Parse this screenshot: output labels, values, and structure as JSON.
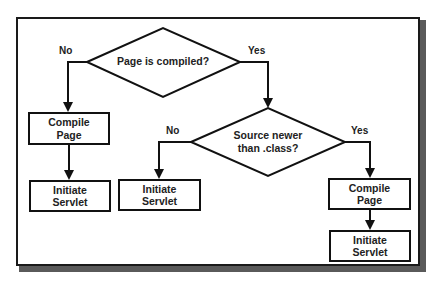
{
  "diagram": {
    "type": "flowchart",
    "decisions": [
      {
        "id": "d1",
        "text": "Page is compiled?"
      },
      {
        "id": "d2",
        "line1": "Source newer",
        "line2": "than .class?"
      }
    ],
    "processes": [
      {
        "id": "p1",
        "line1": "Compile",
        "line2": "Page"
      },
      {
        "id": "p2",
        "line1": "Initiate",
        "line2": "Servlet"
      },
      {
        "id": "p3",
        "line1": "Initiate",
        "line2": "Servlet"
      },
      {
        "id": "p4",
        "line1": "Compile",
        "line2": "Page"
      },
      {
        "id": "p5",
        "line1": "Initiate",
        "line2": "Servlet"
      }
    ],
    "edges": [
      {
        "from": "d1",
        "to": "p1",
        "label": "No"
      },
      {
        "from": "d1",
        "to": "d2",
        "label": "Yes"
      },
      {
        "from": "p1",
        "to": "p2",
        "label": ""
      },
      {
        "from": "d2",
        "to": "p3",
        "label": "No"
      },
      {
        "from": "d2",
        "to": "p4",
        "label": "Yes"
      },
      {
        "from": "p4",
        "to": "p5",
        "label": ""
      }
    ],
    "labels": {
      "d1_no": "No",
      "d1_yes": "Yes",
      "d2_no": "No",
      "d2_yes": "Yes"
    },
    "colors": {
      "stroke": "#111111",
      "background": "#ffffff",
      "shadow": "#5a5a5a"
    }
  }
}
